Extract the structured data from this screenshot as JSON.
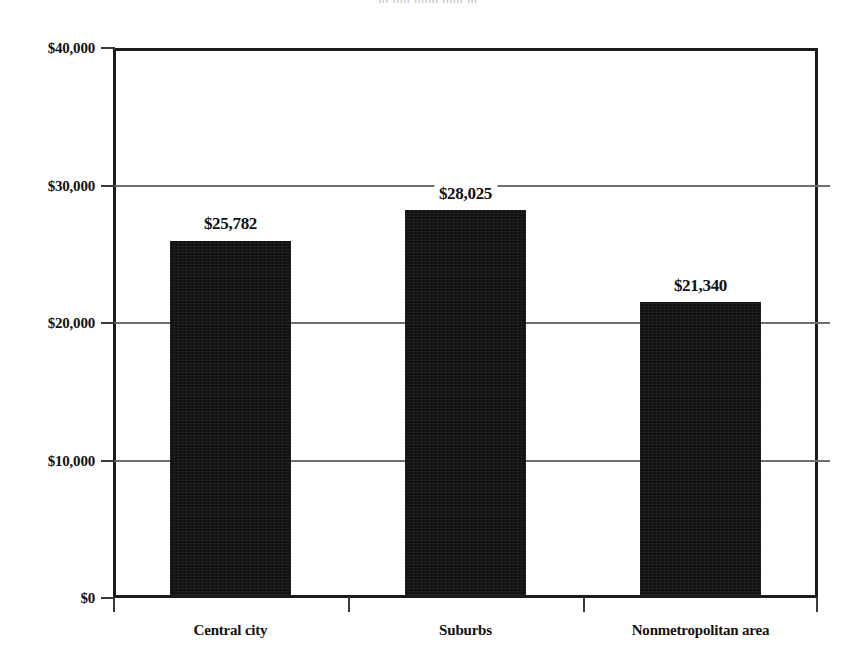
{
  "chart_data": {
    "type": "bar",
    "title": "",
    "xlabel": "",
    "ylabel": "",
    "categories": [
      "Central city",
      "Suburbs",
      "Nonmetropolitan area"
    ],
    "values": [
      25782,
      28025,
      21340
    ],
    "value_labels": [
      "$25,782",
      "$28,025",
      "$21,340"
    ],
    "ylim": [
      0,
      40000
    ],
    "ytick_values": [
      0,
      10000,
      20000,
      30000,
      40000
    ],
    "ytick_labels": [
      "$0",
      "$10,000",
      "$20,000",
      "$30,000",
      "$40,000"
    ],
    "grid": "horizontal",
    "legend": "none",
    "bar_color": "#111111",
    "grid_color": "#6f6f70",
    "axis_color": "#1b1b1b",
    "text_color": "#111111"
  },
  "figure": {
    "title_remnant": "|||   |||||   |||||||   ||||||   |||"
  }
}
